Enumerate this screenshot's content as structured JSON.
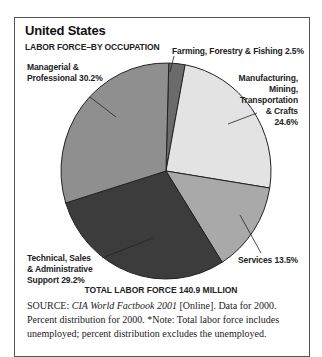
{
  "header": {
    "title": "United States",
    "subtitle": "LABOR FORCE–BY OCCUPATION"
  },
  "labels": {
    "farming": "Farming, Forestry & Fishing 2.5%",
    "manufacturing_1": "Manufacturing,",
    "manufacturing_2": "Mining,",
    "manufacturing_3": "Transportation",
    "manufacturing_4": "& Crafts",
    "manufacturing_5": "24.6%",
    "services": "Services 13.5%",
    "technical_1": "Technical, Sales",
    "technical_2": "& Administrative",
    "technical_3": "Support 29.2%",
    "managerial_1": "Managerial &",
    "managerial_2": "Professional 30.2%"
  },
  "footer": {
    "total": "TOTAL LABOR FORCE 140.9 MILLION",
    "source_label": "SOURCE:",
    "source_title": "CIA World Factbook 2001",
    "source_rest": " [Online]. Data for 2000. Percent distribution for 2000. *Note: Total labor force includes unemployed; percent distribution excludes the unemployed."
  },
  "colors": {
    "farming": "#6b6b6b",
    "manufacturing": "#e3e3e3",
    "services": "#a9a9a9",
    "technical": "#3c3c3c",
    "managerial": "#8f8f8f",
    "outline": "#222222"
  },
  "chart_data": {
    "type": "pie",
    "title": "United States",
    "subtitle": "LABOR FORCE–BY OCCUPATION",
    "categories": [
      "Farming, Forestry & Fishing",
      "Manufacturing, Mining, Transportation & Crafts",
      "Services",
      "Technical, Sales & Administrative Support",
      "Managerial & Professional"
    ],
    "values": [
      2.5,
      24.6,
      13.5,
      29.2,
      30.2
    ],
    "unit": "%",
    "total_label": "TOTAL LABOR FORCE 140.9 MILLION",
    "start_angle_deg": 0,
    "direction": "clockwise",
    "legend": "none (direct labels with leader lines)"
  }
}
